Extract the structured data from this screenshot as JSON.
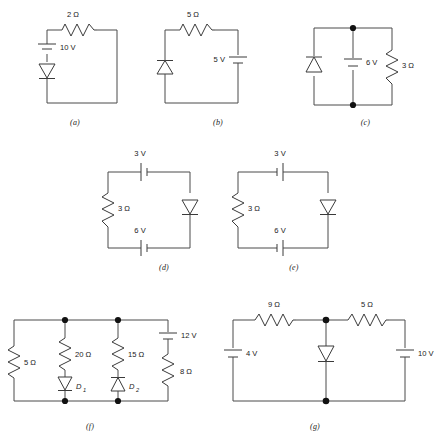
{
  "page": {
    "width": 443,
    "height": 438,
    "background": "#ffffff",
    "ink": "#3a3a3a"
  },
  "figures": [
    {
      "id": "a",
      "caption": "(a)",
      "components": [
        {
          "name": "resistor-2-ohm",
          "type": "resistor",
          "label": "2 Ω",
          "position": "top",
          "orientation": "horizontal"
        },
        {
          "name": "battery-10-v",
          "type": "battery",
          "label": "10 V",
          "position": "left-upper",
          "orientation": "vertical",
          "polarity": "plus-top"
        },
        {
          "name": "diode-a",
          "type": "diode",
          "label": "",
          "position": "left-lower",
          "orientation": "vertical",
          "direction": "down"
        }
      ]
    },
    {
      "id": "b",
      "caption": "(b)",
      "components": [
        {
          "name": "resistor-5-ohm",
          "type": "resistor",
          "label": "5 Ω",
          "position": "top",
          "orientation": "horizontal"
        },
        {
          "name": "diode-b",
          "type": "diode",
          "label": "",
          "position": "left",
          "orientation": "vertical",
          "direction": "up"
        },
        {
          "name": "battery-5-v",
          "type": "battery",
          "label": "5 V",
          "position": "right",
          "orientation": "vertical",
          "polarity": "plus-top"
        }
      ]
    },
    {
      "id": "c",
      "caption": "(c)",
      "components": [
        {
          "name": "diode-c",
          "type": "diode",
          "label": "",
          "position": "left-branch",
          "orientation": "vertical",
          "direction": "up"
        },
        {
          "name": "battery-6-v",
          "type": "battery",
          "label": "6 V",
          "position": "middle-branch",
          "orientation": "vertical",
          "polarity": "plus-top"
        },
        {
          "name": "resistor-3-ohm",
          "type": "resistor",
          "label": "3 Ω",
          "position": "right-branch",
          "orientation": "vertical"
        },
        {
          "name": "junction-top",
          "type": "node"
        },
        {
          "name": "junction-bottom",
          "type": "node"
        }
      ]
    },
    {
      "id": "d",
      "caption": "(d)",
      "components": [
        {
          "name": "battery-3-v",
          "type": "battery",
          "label": "3 V",
          "position": "top",
          "orientation": "horizontal",
          "polarity": "plus-left"
        },
        {
          "name": "resistor-3-ohm",
          "type": "resistor",
          "label": "3 Ω",
          "position": "left",
          "orientation": "vertical"
        },
        {
          "name": "diode-d",
          "type": "diode",
          "label": "",
          "position": "right",
          "orientation": "vertical",
          "direction": "down"
        },
        {
          "name": "battery-6-v",
          "type": "battery",
          "label": "6 V",
          "position": "bottom",
          "orientation": "horizontal",
          "polarity": "plus-left"
        }
      ]
    },
    {
      "id": "e",
      "caption": "(e)",
      "components": [
        {
          "name": "battery-3-v",
          "type": "battery",
          "label": "3 V",
          "position": "top",
          "orientation": "horizontal",
          "polarity": "plus-right"
        },
        {
          "name": "resistor-3-ohm",
          "type": "resistor",
          "label": "3 Ω",
          "position": "left",
          "orientation": "vertical"
        },
        {
          "name": "diode-e",
          "type": "diode",
          "label": "",
          "position": "right",
          "orientation": "vertical",
          "direction": "down"
        },
        {
          "name": "battery-6-v",
          "type": "battery",
          "label": "6 V",
          "position": "bottom",
          "orientation": "horizontal",
          "polarity": "plus-right"
        }
      ]
    },
    {
      "id": "f",
      "caption": "(f)",
      "components": [
        {
          "name": "resistor-5-ohm",
          "type": "resistor",
          "label": "5 Ω",
          "position": "branch-1",
          "orientation": "vertical"
        },
        {
          "name": "resistor-20-ohm",
          "type": "resistor",
          "label": "20 Ω",
          "position": "branch-2-upper",
          "orientation": "vertical"
        },
        {
          "name": "diode-d1",
          "type": "diode",
          "label": "D",
          "sublabel": "1",
          "position": "branch-2-lower",
          "orientation": "vertical",
          "direction": "down"
        },
        {
          "name": "resistor-15-ohm",
          "type": "resistor",
          "label": "15 Ω",
          "position": "branch-3-upper",
          "orientation": "vertical"
        },
        {
          "name": "diode-d2",
          "type": "diode",
          "label": "D",
          "sublabel": "2",
          "position": "branch-3-lower",
          "orientation": "vertical",
          "direction": "up"
        },
        {
          "name": "battery-12-v",
          "type": "battery",
          "label": "12 V",
          "position": "branch-4-upper",
          "orientation": "vertical",
          "polarity": "plus-top"
        },
        {
          "name": "resistor-8-ohm",
          "type": "resistor",
          "label": "8 Ω",
          "position": "branch-4-lower",
          "orientation": "vertical"
        },
        {
          "name": "junction-top-2",
          "type": "node"
        },
        {
          "name": "junction-top-3",
          "type": "node"
        },
        {
          "name": "junction-bottom-2",
          "type": "node"
        },
        {
          "name": "junction-bottom-3",
          "type": "node"
        }
      ]
    },
    {
      "id": "g",
      "caption": "(g)",
      "components": [
        {
          "name": "resistor-9-ohm",
          "type": "resistor",
          "label": "9 Ω",
          "position": "top-left",
          "orientation": "horizontal"
        },
        {
          "name": "resistor-5-ohm",
          "type": "resistor",
          "label": "5 Ω",
          "position": "top-right",
          "orientation": "horizontal"
        },
        {
          "name": "battery-4-v",
          "type": "battery",
          "label": "4 V",
          "position": "left",
          "orientation": "vertical",
          "polarity": "plus-top"
        },
        {
          "name": "diode-g",
          "type": "diode",
          "label": "",
          "position": "middle",
          "orientation": "vertical",
          "direction": "down"
        },
        {
          "name": "battery-10-v",
          "type": "battery",
          "label": "10 V",
          "position": "right",
          "orientation": "vertical",
          "polarity": "plus-top"
        },
        {
          "name": "junction-top",
          "type": "node"
        },
        {
          "name": "junction-bottom",
          "type": "node"
        }
      ]
    }
  ],
  "labels": {
    "a_r1": "2 Ω",
    "a_v1": "10 V",
    "a_cap": "(a)",
    "b_r1": "5 Ω",
    "b_v1": "5 V",
    "b_cap": "(b)",
    "c_v1": "6 V",
    "c_r1": "3 Ω",
    "c_cap": "(c)",
    "d_v1": "3 V",
    "d_r1": "3 Ω",
    "d_v2": "6 V",
    "d_cap": "(d)",
    "e_v1": "3 V",
    "e_r1": "3 Ω",
    "e_v2": "6 V",
    "e_cap": "(e)",
    "f_r1": "5 Ω",
    "f_r2": "20 Ω",
    "f_r3": "15 Ω",
    "f_v1": "12 V",
    "f_r4": "8 Ω",
    "f_d1": "D",
    "f_d1sub": "1",
    "f_d2": "D",
    "f_d2sub": "2",
    "f_cap": "(f)",
    "g_r1": "9 Ω",
    "g_r2": "5 Ω",
    "g_v1": "4 V",
    "g_v2": "10 V",
    "g_cap": "(g)"
  }
}
